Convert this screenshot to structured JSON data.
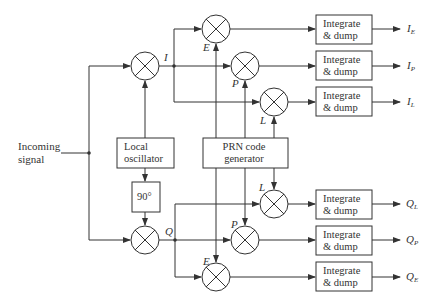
{
  "diagram": {
    "title": "",
    "input": {
      "label_line1": "Incoming",
      "label_line2": "signal"
    },
    "blocks": {
      "local_oscillator": {
        "line1": "Local",
        "line2": "oscillator"
      },
      "phase_shift": {
        "label": "90°"
      },
      "prn_generator": {
        "line1": "PRN code",
        "line2": "generator"
      },
      "integrate_dump": {
        "line1": "Integrate",
        "line2": "& dump"
      }
    },
    "branch_labels": {
      "in_phase": "I",
      "quadrature": "Q"
    },
    "mixer_labels": {
      "upper": {
        "early": "E",
        "prompt": "P",
        "late": "L"
      },
      "lower": {
        "late": "L",
        "prompt": "P",
        "early": "E"
      }
    },
    "outputs": [
      {
        "main": "I",
        "sub": "E"
      },
      {
        "main": "I",
        "sub": "P"
      },
      {
        "main": "I",
        "sub": "L"
      },
      {
        "main": "Q",
        "sub": "L"
      },
      {
        "main": "Q",
        "sub": "P"
      },
      {
        "main": "Q",
        "sub": "E"
      }
    ],
    "colors": {
      "line": "#333333",
      "background": "#ffffff"
    }
  }
}
